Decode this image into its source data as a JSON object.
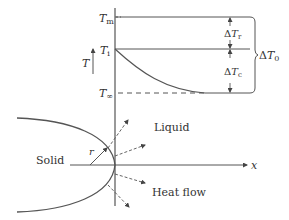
{
  "labels": {
    "T_m": {
      "main": "T",
      "sub": "m"
    },
    "T_i": {
      "main": "T",
      "sub": "i"
    },
    "T_inf": {
      "main": "T",
      "sub": "∞"
    },
    "T_axis": "T",
    "dT_r": {
      "delta": "Δ",
      "main": "T",
      "sub": "r"
    },
    "dT_c": {
      "delta": "Δ",
      "main": "T",
      "sub": "c"
    },
    "dT_0": {
      "delta": "Δ",
      "main": "T",
      "sub": "0"
    },
    "x_axis": "x",
    "r": "r",
    "solid": "Solid",
    "liquid": "Liquid",
    "heat_flow": "Heat flow"
  },
  "colors": {
    "line": "#555555",
    "text": "#333333"
  }
}
